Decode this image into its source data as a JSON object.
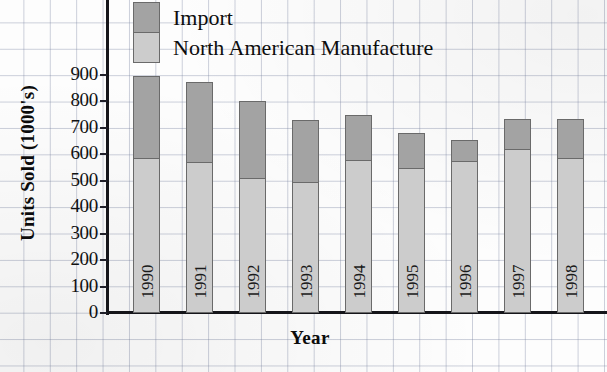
{
  "chart_data": {
    "type": "bar",
    "subtype": "stacked-vertical",
    "title": "",
    "xlabel": "Year",
    "ylabel": "Units Sold (1000's)",
    "categories": [
      "1990",
      "1991",
      "1992",
      "1993",
      "1994",
      "1995",
      "1996",
      "1997",
      "1998"
    ],
    "series": [
      {
        "name": "North American Manufacture",
        "color": "#cccccc",
        "values": [
          585,
          570,
          510,
          495,
          580,
          550,
          575,
          620,
          585
        ]
      },
      {
        "name": "Import",
        "color": "#a3a3a3",
        "values": [
          310,
          305,
          290,
          235,
          170,
          130,
          80,
          115,
          150
        ]
      }
    ],
    "totals": [
      895,
      875,
      800,
      730,
      750,
      680,
      655,
      735,
      735
    ],
    "ylim": [
      0,
      900
    ],
    "ytick_labels": [
      "900",
      "800",
      "700",
      "600",
      "500",
      "400",
      "300",
      "200",
      "100",
      "0"
    ],
    "ytick_values": [
      900,
      800,
      700,
      600,
      500,
      400,
      300,
      200,
      100,
      0
    ],
    "grid": "graph-paper-background",
    "legend_position": "top-left-inside",
    "legend": [
      {
        "label": "Import",
        "color": "#a3a3a3"
      },
      {
        "label": "North American Manufacture",
        "color": "#cccccc"
      }
    ]
  },
  "axes": {
    "y_title": "Units Sold (1000's)",
    "x_title": "Year"
  },
  "colors": {
    "import": "#a3a3a3",
    "north_american": "#cccccc",
    "axis": "#15151a",
    "grid": "#7882a0",
    "text": "#0d0d0d"
  }
}
